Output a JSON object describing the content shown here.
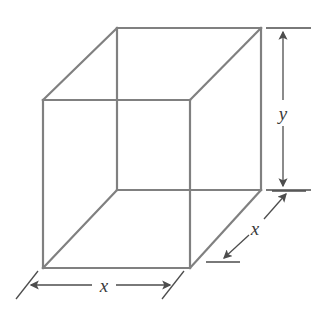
{
  "figure": {
    "type": "geometry-diagram",
    "background_color": "#ffffff",
    "line_color": "#808080",
    "dimension_line_color": "#4d4d4d",
    "label_color": "#3a3a3a",
    "line_width": 2.2,
    "dimension_line_width": 1.3,
    "labels": {
      "height": "y",
      "width": "x",
      "depth": "x"
    },
    "geometry": {
      "front_face": {
        "top_left": [
          43,
          100
        ],
        "top_right": [
          190,
          100
        ],
        "bottom_right": [
          190,
          268
        ],
        "bottom_left": [
          43,
          268
        ]
      },
      "back_face": {
        "top_left": [
          117,
          28
        ],
        "top_right": [
          261,
          28
        ],
        "bottom_right": [
          261,
          190
        ],
        "bottom_left": [
          117,
          190
        ]
      }
    },
    "dimensions": [
      {
        "name": "height-dimension",
        "label": "y",
        "orientation": "vertical",
        "from": [
          283,
          28
        ],
        "to": [
          283,
          190
        ],
        "label_position": [
          283,
          113
        ],
        "extension_ticks": [
          {
            "from": [
              266,
              28
            ],
            "to": [
              311,
              28
            ]
          },
          {
            "from": [
              266,
              190
            ],
            "to": [
              311,
              190
            ]
          }
        ]
      },
      {
        "name": "width-dimension",
        "label": "x",
        "orientation": "horizontal",
        "from": [
          28,
          285
        ],
        "to": [
          172,
          285
        ],
        "label_position": [
          104,
          285
        ],
        "extension_ticks": [
          {
            "from": [
              16,
              299
            ],
            "to": [
              38,
              271
            ]
          },
          {
            "from": [
              162,
              299
            ],
            "to": [
              184,
              271
            ]
          }
        ]
      },
      {
        "name": "depth-dimension",
        "label": "x",
        "orientation": "diagonal",
        "from": [
          222,
          260
        ],
        "to": [
          288,
          192
        ],
        "label_position": [
          255,
          228
        ],
        "extension_ticks": [
          {
            "from": [
              206,
              262
            ],
            "to": [
              240,
              262
            ]
          },
          {
            "from": [
              272,
              191
            ],
            "to": [
              306,
              191
            ]
          }
        ]
      }
    ]
  }
}
